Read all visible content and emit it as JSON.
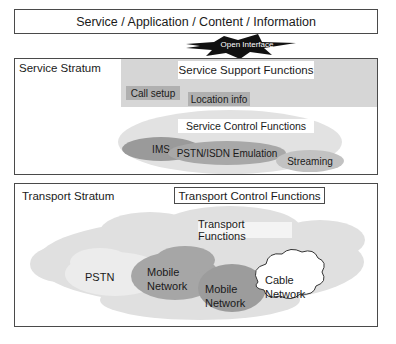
{
  "diagram": {
    "top_layer": {
      "label": "Service / Application / Content / Information"
    },
    "interface": {
      "label": "Open Interface"
    },
    "service_stratum": {
      "label": "Service Stratum",
      "support": {
        "label": "Service Support Functions",
        "items": [
          "Call setup",
          "Location info"
        ]
      },
      "control": {
        "label": "Service Control Functions",
        "items": [
          "IMS",
          "PSTN/ISDN Emulation",
          "Streaming"
        ]
      }
    },
    "transport_stratum": {
      "label": "Transport Stratum",
      "control": {
        "label": "Transport Control Functions"
      },
      "functions": {
        "label": "Transport Functions",
        "networks": [
          {
            "line1": "PSTN",
            "line2": ""
          },
          {
            "line1": "Mobile",
            "line2": "Network"
          },
          {
            "line1": "Mobile",
            "line2": "Network"
          },
          {
            "line1": "Cable",
            "line2": "Network"
          }
        ]
      }
    },
    "colors": {
      "border": "#4a4a4a",
      "support_area": "#d6d6d6",
      "chip": "#b0b0b0",
      "control_ellipse": "#e2e2e2",
      "ims": "#9a9a9a",
      "emulation": "#a8a8a8",
      "streaming": "#c2c2c2",
      "transport_cloud": "#e0e0e0",
      "pstn_cloud": "#ececec",
      "mobile_cloud": "#a6a6a6",
      "mobile_cloud_2": "#9c9c9c",
      "cable_cloud": "#ffffff"
    }
  }
}
